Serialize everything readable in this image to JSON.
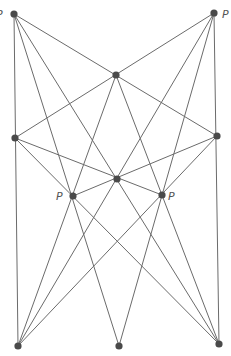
{
  "diagram": {
    "type": "point-line configuration",
    "colors": {
      "line": "#6b6b6b",
      "point": "#4a4a4a",
      "label": "#555555",
      "background": "#ffffff"
    },
    "points": [
      {
        "id": "A",
        "x": 14,
        "y": 14,
        "label": "P",
        "label_x": -4,
        "label_y": 18
      },
      {
        "id": "B",
        "x": 214,
        "y": 13,
        "label": "P",
        "label_x": 222,
        "label_y": 18
      },
      {
        "id": "C",
        "x": 116,
        "y": 75,
        "label": ""
      },
      {
        "id": "D",
        "x": 15,
        "y": 138,
        "label": ""
      },
      {
        "id": "E",
        "x": 217,
        "y": 136,
        "label": ""
      },
      {
        "id": "F",
        "x": 117,
        "y": 179,
        "label": ""
      },
      {
        "id": "G",
        "x": 73,
        "y": 196,
        "label": "P",
        "label_x": 56,
        "label_y": 200
      },
      {
        "id": "H",
        "x": 162,
        "y": 195,
        "label": "P",
        "label_x": 168,
        "label_y": 200
      },
      {
        "id": "I",
        "x": 18,
        "y": 346,
        "label": ""
      },
      {
        "id": "J",
        "x": 119,
        "y": 346,
        "label": ""
      },
      {
        "id": "K",
        "x": 219,
        "y": 344,
        "label": ""
      }
    ],
    "lines": [
      [
        "A",
        "I"
      ],
      [
        "B",
        "K"
      ],
      [
        "A",
        "E"
      ],
      [
        "B",
        "D"
      ],
      [
        "D",
        "K"
      ],
      [
        "E",
        "I"
      ],
      [
        "D",
        "H"
      ],
      [
        "E",
        "G"
      ],
      [
        "A",
        "J"
      ],
      [
        "B",
        "J"
      ],
      [
        "A",
        "K"
      ],
      [
        "B",
        "I"
      ],
      [
        "C",
        "I"
      ],
      [
        "C",
        "K"
      ]
    ]
  }
}
